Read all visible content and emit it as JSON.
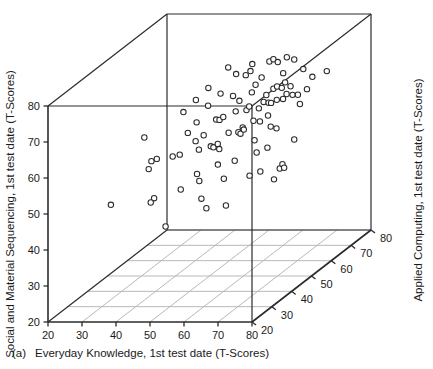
{
  "figure": {
    "panel_label": "(a)",
    "marker_style": "open-circle",
    "colors": {
      "axis": "#2b2b2b",
      "grid": "#b9b9b9",
      "marker_stroke": "#2b2b2b",
      "marker_fill": "#ffffff",
      "text": "#1a1a1a",
      "background": "#ffffff"
    }
  },
  "chart_data": {
    "type": "scatter",
    "title": "",
    "xlabel": "Everyday Knowledge, 1st test date (T-Scores)",
    "ylabel": "Social and Material Sequencing, 1st test date (T-Scores)",
    "zlabel": "Applied Computing, 1st test date (T-Scores)",
    "xlim": [
      20,
      80
    ],
    "ylim": [
      20,
      80
    ],
    "zlim": [
      20,
      80
    ],
    "xticks": [
      20,
      30,
      40,
      50,
      60,
      70,
      80
    ],
    "yticks": [
      20,
      30,
      40,
      50,
      60,
      70,
      80
    ],
    "zticks": [
      20,
      30,
      40,
      50,
      60,
      70,
      80
    ],
    "grid": true,
    "grid_plane": "floor",
    "legend": "none",
    "projection": "3d-box",
    "points": [
      {
        "x": 59.0,
        "y": 80.5,
        "z": 44.0
      },
      {
        "x": 65.5,
        "y": 81.0,
        "z": 45.0
      },
      {
        "x": 62.5,
        "y": 79.5,
        "z": 42.0
      },
      {
        "x": 68.2,
        "y": 80.0,
        "z": 49.0
      },
      {
        "x": 68.8,
        "y": 80.2,
        "z": 50.0
      },
      {
        "x": 69.5,
        "y": 79.0,
        "z": 51.0
      },
      {
        "x": 71.0,
        "y": 79.5,
        "z": 53.0
      },
      {
        "x": 55.5,
        "y": 76.5,
        "z": 40.0
      },
      {
        "x": 63.0,
        "y": 77.5,
        "z": 46.0
      },
      {
        "x": 63.8,
        "y": 78.2,
        "z": 47.0
      },
      {
        "x": 66.5,
        "y": 76.0,
        "z": 48.0
      },
      {
        "x": 72.0,
        "y": 78.0,
        "z": 55.0
      },
      {
        "x": 53.0,
        "y": 74.0,
        "z": 38.0
      },
      {
        "x": 58.5,
        "y": 74.5,
        "z": 41.0
      },
      {
        "x": 61.0,
        "y": 73.0,
        "z": 43.0
      },
      {
        "x": 65.0,
        "y": 74.2,
        "z": 47.5
      },
      {
        "x": 70.5,
        "y": 75.5,
        "z": 52.0
      },
      {
        "x": 73.5,
        "y": 74.5,
        "z": 57.0
      },
      {
        "x": 50.5,
        "y": 71.5,
        "z": 36.0
      },
      {
        "x": 56.0,
        "y": 72.0,
        "z": 39.0
      },
      {
        "x": 62.0,
        "y": 71.0,
        "z": 44.5
      },
      {
        "x": 64.5,
        "y": 72.5,
        "z": 46.5
      },
      {
        "x": 67.0,
        "y": 70.5,
        "z": 49.5
      },
      {
        "x": 68.5,
        "y": 71.8,
        "z": 50.5
      },
      {
        "x": 69.0,
        "y": 72.0,
        "z": 51.5
      },
      {
        "x": 69.8,
        "y": 71.2,
        "z": 52.5
      },
      {
        "x": 70.2,
        "y": 72.3,
        "z": 53.5
      },
      {
        "x": 71.5,
        "y": 71.0,
        "z": 54.0
      },
      {
        "x": 75.0,
        "y": 71.5,
        "z": 59.0
      },
      {
        "x": 77.5,
        "y": 71.8,
        "z": 62.0
      },
      {
        "x": 42.5,
        "y": 67.0,
        "z": 30.0
      },
      {
        "x": 53.5,
        "y": 68.0,
        "z": 37.5
      },
      {
        "x": 57.5,
        "y": 67.5,
        "z": 40.5
      },
      {
        "x": 58.2,
        "y": 67.2,
        "z": 41.0
      },
      {
        "x": 59.0,
        "y": 67.8,
        "z": 41.5
      },
      {
        "x": 61.5,
        "y": 68.5,
        "z": 43.5
      },
      {
        "x": 63.5,
        "y": 68.0,
        "z": 45.5
      },
      {
        "x": 64.0,
        "y": 68.8,
        "z": 46.0
      },
      {
        "x": 65.8,
        "y": 67.5,
        "z": 47.8
      },
      {
        "x": 66.8,
        "y": 69.0,
        "z": 48.5
      },
      {
        "x": 67.5,
        "y": 68.2,
        "z": 49.8
      },
      {
        "x": 68.0,
        "y": 68.0,
        "z": 50.2
      },
      {
        "x": 69.2,
        "y": 68.5,
        "z": 51.0
      },
      {
        "x": 70.0,
        "y": 68.0,
        "z": 52.8
      },
      {
        "x": 70.8,
        "y": 69.2,
        "z": 53.2
      },
      {
        "x": 71.8,
        "y": 68.4,
        "z": 54.5
      },
      {
        "x": 72.5,
        "y": 67.8,
        "z": 56.0
      },
      {
        "x": 74.0,
        "y": 68.5,
        "z": 58.0
      },
      {
        "x": 51.5,
        "y": 65.5,
        "z": 36.5
      },
      {
        "x": 55.0,
        "y": 64.0,
        "z": 38.5
      },
      {
        "x": 60.0,
        "y": 63.0,
        "z": 42.5
      },
      {
        "x": 62.8,
        "y": 63.5,
        "z": 44.8
      },
      {
        "x": 64.8,
        "y": 64.5,
        "z": 46.8
      },
      {
        "x": 66.0,
        "y": 63.8,
        "z": 48.0
      },
      {
        "x": 67.8,
        "y": 65.0,
        "z": 49.0
      },
      {
        "x": 72.8,
        "y": 65.0,
        "z": 56.5
      },
      {
        "x": 44.0,
        "y": 60.0,
        "z": 31.0
      },
      {
        "x": 45.0,
        "y": 60.2,
        "z": 32.0
      },
      {
        "x": 43.5,
        "y": 58.0,
        "z": 30.5
      },
      {
        "x": 48.5,
        "y": 60.0,
        "z": 34.0
      },
      {
        "x": 50.0,
        "y": 60.1,
        "z": 35.0
      },
      {
        "x": 53.5,
        "y": 63.0,
        "z": 37.0
      },
      {
        "x": 54.0,
        "y": 60.3,
        "z": 37.8
      },
      {
        "x": 56.5,
        "y": 60.5,
        "z": 39.5
      },
      {
        "x": 57.0,
        "y": 60.0,
        "z": 40.0
      },
      {
        "x": 57.8,
        "y": 60.6,
        "z": 40.8
      },
      {
        "x": 58.0,
        "y": 59.0,
        "z": 41.2
      },
      {
        "x": 62.0,
        "y": 62.5,
        "z": 44.0
      },
      {
        "x": 62.5,
        "y": 62.0,
        "z": 44.2
      },
      {
        "x": 63.0,
        "y": 62.8,
        "z": 45.0
      },
      {
        "x": 65.0,
        "y": 59.0,
        "z": 47.0
      },
      {
        "x": 68.0,
        "y": 61.5,
        "z": 50.0
      },
      {
        "x": 69.0,
        "y": 60.5,
        "z": 51.2
      },
      {
        "x": 53.8,
        "y": 53.8,
        "z": 37.2
      },
      {
        "x": 58.0,
        "y": 55.0,
        "z": 40.5
      },
      {
        "x": 61.5,
        "y": 55.0,
        "z": 43.0
      },
      {
        "x": 65.5,
        "y": 55.5,
        "z": 47.2
      },
      {
        "x": 67.5,
        "y": 56.0,
        "z": 49.2
      },
      {
        "x": 72.0,
        "y": 55.8,
        "z": 55.0
      },
      {
        "x": 35.0,
        "y": 50.0,
        "z": 26.0
      },
      {
        "x": 44.5,
        "y": 49.5,
        "z": 31.5
      },
      {
        "x": 43.8,
        "y": 48.5,
        "z": 31.0
      },
      {
        "x": 50.0,
        "y": 50.2,
        "z": 35.5
      },
      {
        "x": 54.0,
        "y": 51.5,
        "z": 38.0
      },
      {
        "x": 59.0,
        "y": 50.5,
        "z": 41.8
      },
      {
        "x": 64.0,
        "y": 49.5,
        "z": 46.2
      },
      {
        "x": 66.0,
        "y": 49.8,
        "z": 48.2
      },
      {
        "x": 69.5,
        "y": 49.0,
        "z": 52.0
      },
      {
        "x": 70.0,
        "y": 50.0,
        "z": 52.5
      },
      {
        "x": 70.2,
        "y": 48.8,
        "z": 53.0
      },
      {
        "x": 54.5,
        "y": 46.5,
        "z": 38.2
      },
      {
        "x": 68.5,
        "y": 46.5,
        "z": 50.8
      },
      {
        "x": 55.5,
        "y": 43.5,
        "z": 39.0
      },
      {
        "x": 59.5,
        "y": 43.0,
        "z": 42.0
      },
      {
        "x": 47.0,
        "y": 41.0,
        "z": 33.0
      }
    ]
  }
}
